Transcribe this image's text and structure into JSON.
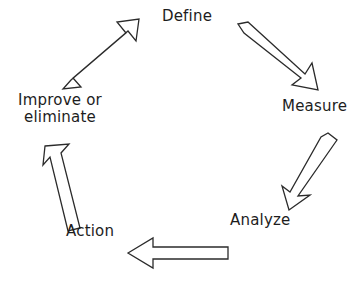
{
  "diagram": {
    "type": "cycle-diagram",
    "background_color": "#ffffff",
    "stroke_color": "#2b2b2b",
    "text_color": "#1d1d1d",
    "nodes": [
      {
        "id": "define",
        "label": "Define"
      },
      {
        "id": "measure",
        "label": "Measure"
      },
      {
        "id": "analyze",
        "label": "Analyze"
      },
      {
        "id": "action",
        "label": "Action"
      },
      {
        "id": "improve",
        "label": "Improve or\neliminate"
      }
    ],
    "arrows": [
      {
        "id": "define-to-measure",
        "from": "Define",
        "to": "Measure",
        "direction": "down-right"
      },
      {
        "id": "measure-to-analyze",
        "from": "Measure",
        "to": "Analyze",
        "direction": "down-left"
      },
      {
        "id": "analyze-to-action",
        "from": "Analyze",
        "to": "Action",
        "direction": "left"
      },
      {
        "id": "action-to-improve",
        "from": "Action",
        "to": "Improve or eliminate",
        "direction": "up"
      },
      {
        "id": "improve-to-define",
        "from": "Improve or eliminate",
        "to": "Define",
        "direction": "up-right"
      }
    ]
  }
}
